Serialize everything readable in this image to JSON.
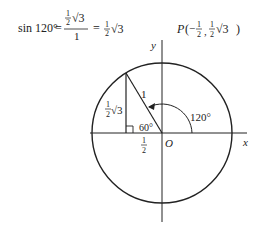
{
  "equation": {
    "lhs": "sin 120°",
    "eq1": "=",
    "frac_num_coef_num": "1",
    "frac_num_coef_den": "2",
    "frac_num_root": "√3",
    "frac_den": "1",
    "eq2": "=",
    "rhs_coef_num": "1",
    "rhs_coef_den": "2",
    "rhs_root": "√3"
  },
  "point": {
    "label": "P",
    "open": "(",
    "x_sign": "−",
    "x_num": "1",
    "x_den": "2",
    "comma": ",",
    "y_num": "1",
    "y_den": "2",
    "y_root": "√3",
    "close": ")"
  },
  "axes": {
    "x_label": "x",
    "y_label": "y",
    "origin_label": "O"
  },
  "triangle": {
    "hypotenuse_label": "1",
    "height_coef_num": "1",
    "height_coef_den": "2",
    "height_root": "√3",
    "base_num": "1",
    "base_den": "2",
    "angle_label": "60°"
  },
  "arc": {
    "angle_label": "120°"
  }
}
